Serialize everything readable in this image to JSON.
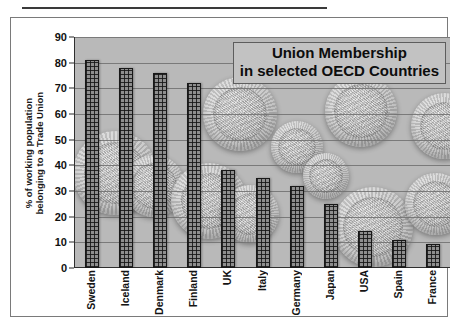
{
  "chart_data": {
    "type": "bar",
    "title": "Union Membership in selected OECD Countries",
    "title_lines": [
      "Union Membership",
      "in selected OECD Countries"
    ],
    "xlabel": "",
    "ylabel": "% of working population belonging to a Trade Union",
    "ylabel_lines": [
      "% of working population",
      "belonging to a Trade Union"
    ],
    "categories": [
      "Sweden",
      "Iceland",
      "Denmark",
      "Finland",
      "UK",
      "Italy",
      "Germany",
      "Japan",
      "USA",
      "Spain",
      "France"
    ],
    "values": [
      81,
      78,
      76,
      72,
      38,
      35,
      32,
      25,
      14.5,
      11,
      9.5
    ],
    "ylim": [
      0,
      90
    ],
    "ytick_step": 10,
    "yticks": [
      0,
      10,
      20,
      30,
      40,
      50,
      60,
      70,
      80,
      90
    ],
    "grid": true,
    "legend": "none",
    "bar_fill": "crosshatch-grid",
    "plot_background": "grayscale coin photograph",
    "colors": {
      "plot_background": "#b9b9b9",
      "bar_fill": "#8e8e8e",
      "bar_border": "#181818",
      "gridline": "#6e6e6e",
      "title_box_background": "#c2c2c2",
      "text": "#111111",
      "frame_border": "#7a7a7a"
    }
  }
}
